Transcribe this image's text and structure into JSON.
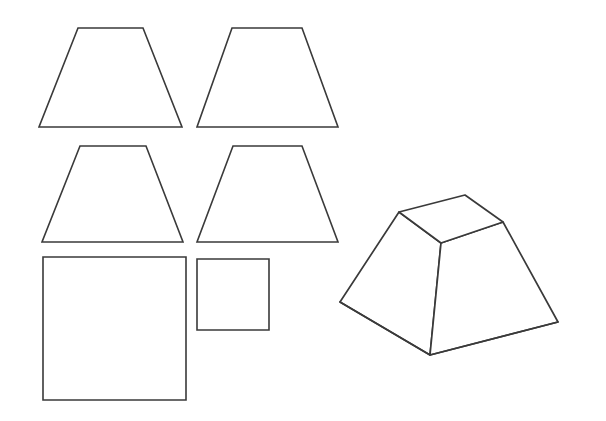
{
  "document": {
    "title": "Net and solid of a square frustum",
    "background_color": "#ffffff",
    "stroke_color": "#3a3a3a",
    "fill_color": "#ffffff",
    "width": 606,
    "height": 421
  },
  "chart_data": {
    "type": "diagram",
    "subtitle": "",
    "xlabel": "",
    "ylabel": "",
    "grid": false,
    "legend": null,
    "annotations": [],
    "shapes": [
      {
        "name": "trapezoid-top-left",
        "role": "lateral-face-net",
        "kind": "isosceles-trapezoid",
        "points": "78,28 143,28 182,127 39,127",
        "top_width": 65,
        "bottom_width": 143,
        "height": 99
      },
      {
        "name": "trapezoid-top-right",
        "role": "lateral-face-net",
        "kind": "isosceles-trapezoid",
        "points": "232,28 302,28 338,127 197,127",
        "top_width": 70,
        "bottom_width": 141,
        "height": 99
      },
      {
        "name": "trapezoid-middle-left",
        "role": "lateral-face-net",
        "kind": "isosceles-trapezoid",
        "points": "80,146 146,146 183,242 42,242",
        "top_width": 66,
        "bottom_width": 141,
        "height": 96
      },
      {
        "name": "trapezoid-middle-right",
        "role": "lateral-face-net",
        "kind": "isosceles-trapezoid",
        "points": "233,146 302,146 338,242 197,242",
        "top_width": 69,
        "bottom_width": 141,
        "height": 96
      },
      {
        "name": "square-large",
        "role": "base-face-net",
        "kind": "square",
        "points": "43,257 186,257 186,400 43,400",
        "side": 143
      },
      {
        "name": "square-small",
        "role": "top-face-net",
        "kind": "square",
        "points": "197,259 269,259 269,330 197,330",
        "side": 71
      }
    ],
    "solid": {
      "name": "square-frustum-3d",
      "kind": "frustum",
      "top_face": "399,212 465,195 503,222 441,243",
      "left_face": "399,212 441,243 430,355 340,302",
      "right_face": "441,243 503,222 558,322 430,355",
      "base_edges": "340,302 430,355 558,322",
      "vertices": {
        "top_left": [
          399,
          212
        ],
        "top_back": [
          465,
          195
        ],
        "top_right": [
          503,
          222
        ],
        "top_front": [
          441,
          243
        ],
        "bottom_left": [
          340,
          302
        ],
        "bottom_front": [
          430,
          355
        ],
        "bottom_right": [
          558,
          322
        ]
      }
    }
  }
}
